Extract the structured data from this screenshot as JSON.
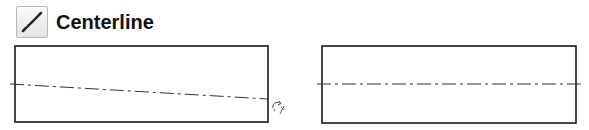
{
  "header": {
    "icon": "centerline-icon",
    "title": "Centerline"
  },
  "diagrams": [
    {
      "name": "before",
      "description": "Rectangle with a tilted centerline and rotate cursor",
      "rect": {
        "x": 15,
        "y": 46,
        "w": 253,
        "h": 76
      },
      "centerline": {
        "x1": 10,
        "y1": 84,
        "x2": 268,
        "y2": 99
      },
      "cursor": "rotate-cursor-icon"
    },
    {
      "name": "after",
      "description": "Rectangle with a horizontal centerline",
      "rect": {
        "x": 322,
        "y": 46,
        "w": 254,
        "h": 77
      },
      "centerline": {
        "x1": 317,
        "y1": 84,
        "x2": 582,
        "y2": 84
      }
    }
  ],
  "colors": {
    "stroke": "#1a1a1a",
    "centerline": "#333333",
    "icon_border": "#b8b8b8"
  }
}
